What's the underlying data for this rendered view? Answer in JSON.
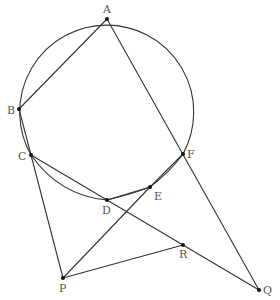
{
  "diagram": {
    "type": "geometry",
    "points": {
      "A": {
        "label": "A",
        "x": 107,
        "y": 19,
        "lx": 103,
        "ly": 13
      },
      "B": {
        "label": "B",
        "x": 19,
        "y": 109,
        "lx": 7,
        "ly": 114
      },
      "C": {
        "label": "C",
        "x": 31,
        "y": 155,
        "lx": 18,
        "ly": 160
      },
      "D": {
        "label": "D",
        "x": 107,
        "y": 200,
        "lx": 102,
        "ly": 214
      },
      "E": {
        "label": "E",
        "x": 150,
        "y": 187,
        "lx": 154,
        "ly": 200
      },
      "F": {
        "label": "F",
        "x": 183,
        "y": 154,
        "lx": 187,
        "ly": 158
      },
      "P": {
        "label": "P",
        "x": 63,
        "y": 278,
        "lx": 59,
        "ly": 292
      },
      "R": {
        "label": "R",
        "x": 183,
        "y": 245,
        "lx": 179,
        "ly": 258
      },
      "Q": {
        "label": "Q",
        "x": 259,
        "y": 290,
        "lx": 263,
        "ly": 294
      }
    },
    "segments": [
      "AB",
      "AQ",
      "CP",
      "CQ",
      "PE",
      "PR",
      "FQ",
      "BC",
      "DE",
      "EF"
    ],
    "circle": {
      "cx": 106,
      "cy": 104,
      "r": 87
    }
  }
}
